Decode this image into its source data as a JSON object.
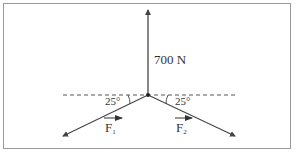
{
  "diagram": {
    "type": "force-diagram",
    "center": {
      "x": 148,
      "y": 95
    },
    "colors": {
      "line": "#444444",
      "text": "#333333",
      "border": "#9a9a9a",
      "background": "#ffffff"
    },
    "vertical_force": {
      "label": "700 N",
      "direction": "up"
    },
    "reference_line": {
      "style": "dashed",
      "orientation": "horizontal"
    },
    "left_force": {
      "label": "F",
      "subscript": "1",
      "vector_arrow": true,
      "angle_label": "25°",
      "angle_deg": 25,
      "direction": "down-left"
    },
    "right_force": {
      "label": "F",
      "subscript": "2",
      "vector_arrow": true,
      "angle_label": "25°",
      "angle_deg": 25,
      "direction": "down-right"
    }
  }
}
